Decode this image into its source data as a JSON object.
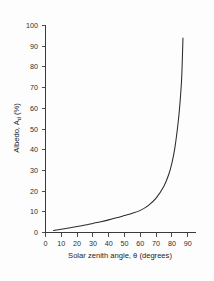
{
  "chart_data": {
    "type": "line",
    "title": "",
    "subtitle": "",
    "xlabel_parts": {
      "main": "Solar zenith angle, ",
      "symbol": "θ",
      "units": "  (degrees)"
    },
    "xlabel": "Solar zenith angle, θ  (degrees)",
    "ylabel_parts": {
      "main": "Albedo, A",
      "subscript": "d",
      "units": " (%)"
    },
    "ylabel": "Albedo, A_d (%)",
    "xlim": [
      0,
      93
    ],
    "ylim": [
      0,
      103
    ],
    "xticks": [
      0,
      10,
      20,
      30,
      40,
      50,
      60,
      70,
      80,
      90
    ],
    "yticks": [
      0,
      10,
      20,
      30,
      40,
      50,
      60,
      70,
      80,
      90,
      100
    ],
    "xtick_labels": [
      "0",
      "10",
      "20",
      "30",
      "40",
      "50",
      "60",
      "70",
      "80",
      "90"
    ],
    "ytick_labels": [
      "0",
      "10",
      "20",
      "30",
      "40",
      "50",
      "60",
      "70",
      "80",
      "90",
      "100"
    ],
    "grid": false,
    "legend": null,
    "legend_position": "none",
    "annotations": [],
    "series": [
      {
        "name": "Direct-beam albedo",
        "color": "#2b2b2b",
        "style": "solid",
        "x": [
          5,
          10,
          15,
          20,
          25,
          30,
          35,
          40,
          45,
          50,
          55,
          60,
          65,
          70,
          75,
          78,
          80,
          82,
          84,
          85,
          86,
          86.5,
          87
        ],
        "y": [
          1.0,
          1.6,
          2.2,
          2.9,
          3.6,
          4.4,
          5.2,
          6.1,
          7.1,
          8.2,
          9.3,
          10.7,
          13.0,
          16.6,
          22.5,
          28.0,
          33.5,
          41.5,
          53.5,
          61.5,
          72.0,
          81.0,
          94.0
        ]
      }
    ]
  },
  "axis_style": {
    "axis_color": "#3a3a3a",
    "text_color": "#2e2e2e",
    "background": "#fdfdfd",
    "curve_color": "#2b2b2b"
  }
}
